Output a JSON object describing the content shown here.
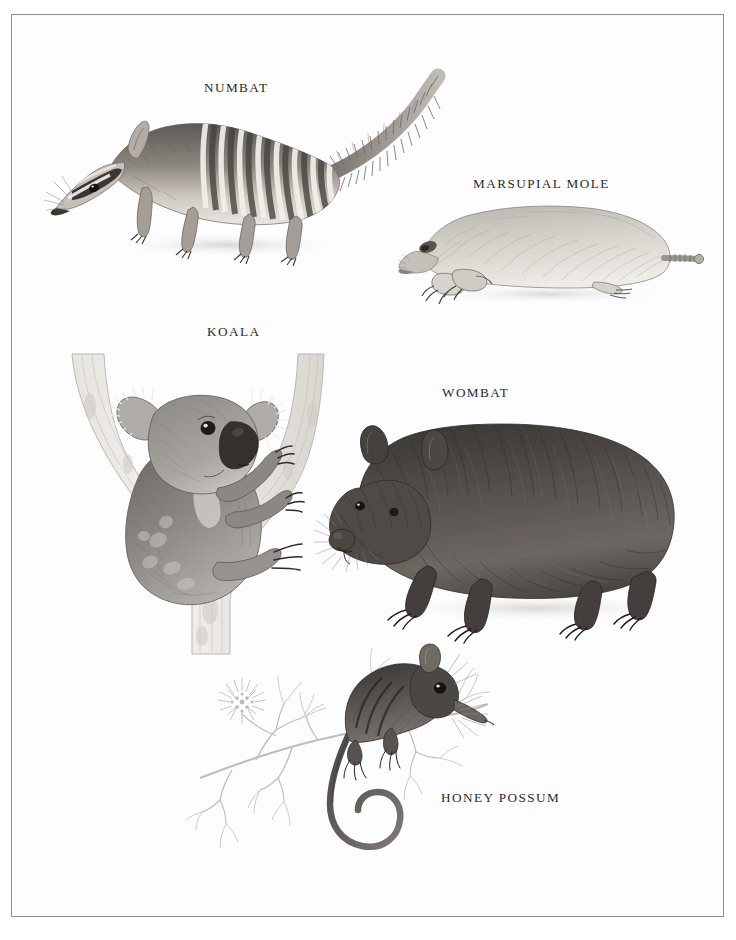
{
  "plate": {
    "kind": "scientific-illustration-plate",
    "subject": "Australian marsupials",
    "medium": "graphite pencil, grayscale",
    "page_background": "#fdfdfd",
    "frame_color": "#8d8d90",
    "ink_color": "#2a2a2d"
  },
  "figures": [
    {
      "id": "numbat",
      "label": "NUMBAT",
      "label_x": 245,
      "label_y": 88,
      "pose": "walking left, striped back, long bushy upright tail",
      "tone": "medium grey with white transverse stripes"
    },
    {
      "id": "marsupial-mole",
      "label": "MARSUPIAL MOLE",
      "label_x": 535,
      "label_y": 184,
      "pose": "crouched on ground, large digging claws, stubby knobbed tail",
      "tone": "pale silvery grey"
    },
    {
      "id": "koala",
      "label": "KOALA",
      "label_x": 231,
      "label_y": 332,
      "pose": "clinging to forked eucalypt branch, facing right",
      "tone": "soft mottled grey, dark nose"
    },
    {
      "id": "wombat",
      "label": "WOMBAT",
      "label_x": 473,
      "label_y": 393,
      "pose": "standing four-square, facing left, stocky body",
      "tone": "dark brown-grey dense fur"
    },
    {
      "id": "honey-possum",
      "label": "HONEY POSSUM",
      "label_x": 493,
      "label_y": 798,
      "pose": "perched on slender flowering branch, prehensile tail curled",
      "tone": "dark grey with darker dorsal stripes"
    }
  ]
}
